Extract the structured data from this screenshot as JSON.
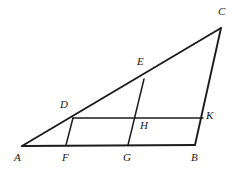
{
  "figure": {
    "stroke_color": "#1c1c1c",
    "background_color": "#ffffff",
    "label_color": "#161616",
    "points": {
      "A": {
        "label": "A",
        "x": 22,
        "y": 146,
        "label_x": 14,
        "label_y": 152
      },
      "B": {
        "label": "B",
        "x": 195,
        "y": 145,
        "label_x": 191,
        "label_y": 152
      },
      "C": {
        "label": "C",
        "x": 221,
        "y": 28,
        "label_x": 218,
        "label_y": 6
      },
      "D": {
        "label": "D",
        "x": 73,
        "y": 118,
        "label_x": 60,
        "label_y": 99
      },
      "E": {
        "label": "E",
        "x": 144,
        "y": 79,
        "label_x": 137,
        "label_y": 56
      },
      "F": {
        "label": "F",
        "x": 66,
        "y": 145,
        "label_x": 62,
        "label_y": 152
      },
      "G": {
        "label": "G",
        "x": 128,
        "y": 145,
        "label_x": 123,
        "label_y": 152
      },
      "H": {
        "label": "H",
        "x": 139,
        "y": 118,
        "label_x": 140,
        "label_y": 120
      },
      "K": {
        "label": "K",
        "x": 203,
        "y": 118,
        "label_x": 206,
        "label_y": 110
      }
    },
    "segments": [
      {
        "name": "segment-AB-base",
        "from": "A",
        "to": "B",
        "weight": "thick"
      },
      {
        "name": "segment-AC-hypotenuse",
        "from": "A",
        "to": "C",
        "weight": "thick"
      },
      {
        "name": "segment-CB-right-side",
        "from": "C",
        "to": "B",
        "weight": "thick"
      },
      {
        "name": "segment-DK-parallel",
        "from": "D",
        "to": "K",
        "weight": "thin"
      },
      {
        "name": "segment-DF-cevian",
        "from": "D",
        "to": "F",
        "weight": "thin"
      },
      {
        "name": "segment-EG-cevian",
        "from": "E",
        "to": "G",
        "weight": "thin"
      }
    ]
  }
}
